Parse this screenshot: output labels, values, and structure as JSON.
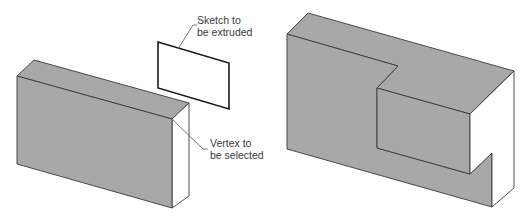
{
  "figure": {
    "colors": {
      "face_gray": "#a8a8a8",
      "edge": "#3a3a3a",
      "side_white": "#ffffff",
      "label_text": "#3a3a3a"
    }
  },
  "annotations": {
    "sketch": {
      "line1": "Sketch to",
      "line2": "be extruded"
    },
    "vertex": {
      "line1": "Vertex to",
      "line2": "be selected"
    }
  }
}
